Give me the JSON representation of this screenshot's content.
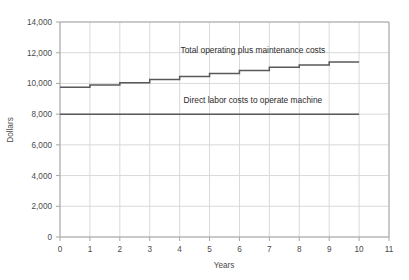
{
  "chart_data": {
    "type": "line",
    "title": "",
    "xlabel": "Years",
    "ylabel": "Dollars",
    "xlim": [
      0,
      11
    ],
    "ylim": [
      0,
      14000
    ],
    "grid": true,
    "legend_position": "none",
    "x_ticks": [
      "0",
      "1",
      "2",
      "3",
      "4",
      "5",
      "6",
      "7",
      "8",
      "9",
      "10",
      "11"
    ],
    "y_ticks": [
      "0",
      "2,000",
      "4,000",
      "6,000",
      "8,000",
      "10,000",
      "12,000",
      "14,000"
    ],
    "x_tick_values": [
      0,
      1,
      2,
      3,
      4,
      5,
      6,
      7,
      8,
      9,
      10,
      11
    ],
    "y_tick_values": [
      0,
      2000,
      4000,
      6000,
      8000,
      10000,
      12000,
      14000
    ],
    "series": [
      {
        "name": "Total operating plus maintenance costs",
        "style": "step",
        "color": "#595959",
        "x": [
          0,
          1,
          2,
          3,
          4,
          5,
          6,
          7,
          8,
          9,
          10
        ],
        "values": [
          9750,
          9900,
          10050,
          10250,
          10450,
          10650,
          10850,
          11050,
          11200,
          11400,
          11400
        ]
      },
      {
        "name": "Direct labor costs to operate machine",
        "style": "flat",
        "color": "#595959",
        "x": [
          0,
          10
        ],
        "values": [
          8000,
          8000
        ]
      }
    ],
    "annotations": [
      {
        "text": "Total operating plus maintenance costs",
        "x": 6.45,
        "y": 11950,
        "anchor": "middle"
      },
      {
        "text": "Direct labor costs to operate machine",
        "x": 6.45,
        "y": 8700,
        "anchor": "middle"
      }
    ]
  },
  "colors": {
    "plot_line": "#595959",
    "grid": "#d9d9d9",
    "axis": "#a6a6a6",
    "tick_text": "#4a4a4a",
    "annotation_text": "#2b2b2b",
    "background": "#ffffff"
  }
}
